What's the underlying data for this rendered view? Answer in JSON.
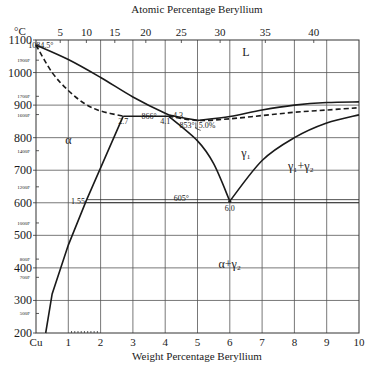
{
  "chart_data": {
    "type": "line",
    "xlabel": "Weight Percentage Beryllium",
    "x2label": "Atomic Percentage Beryllium",
    "ylabel": "°C",
    "xlim": [
      0,
      10
    ],
    "ylim": [
      200,
      1100
    ],
    "grid": true,
    "x_ticks": [
      "Cu",
      "1",
      "2",
      "3",
      "4",
      "5",
      "6",
      "7",
      "8",
      "9",
      "10"
    ],
    "x2_ticks": [
      {
        "label": "5",
        "wt": 0.75
      },
      {
        "label": "10",
        "wt": 1.56
      },
      {
        "label": "15",
        "wt": 2.44
      },
      {
        "label": "20",
        "wt": 3.4
      },
      {
        "label": "25",
        "wt": 4.5
      },
      {
        "label": "30",
        "wt": 5.7
      },
      {
        "label": "35",
        "wt": 7.1
      },
      {
        "label": "40",
        "wt": 8.6
      }
    ],
    "y_ticks": [
      {
        "label": "1100",
        "value": 1100
      },
      {
        "label": "1000",
        "value": 1000
      },
      {
        "label": "900",
        "value": 900
      },
      {
        "label": "800",
        "value": 800
      },
      {
        "label": "700",
        "value": 700
      },
      {
        "label": "600",
        "value": 600
      },
      {
        "label": "500",
        "value": 500
      },
      {
        "label": "400",
        "value": 400
      },
      {
        "label": "300",
        "value": 300
      },
      {
        "label": "200",
        "value": 200
      }
    ],
    "fahrenheit_ticks": [
      {
        "label": "1900F",
        "value": 1038
      },
      {
        "label": "1700F",
        "value": 927
      },
      {
        "label": "1600F",
        "value": 871
      },
      {
        "label": "1400F",
        "value": 760
      },
      {
        "label": "1200F",
        "value": 649
      },
      {
        "label": "1000F",
        "value": 538
      },
      {
        "label": "800F",
        "value": 427
      },
      {
        "label": "700F",
        "value": 371
      },
      {
        "label": "500F",
        "value": 260
      }
    ],
    "series": [
      {
        "name": "liquidus-alpha",
        "style": "solid",
        "points": [
          [
            0,
            1084.5
          ],
          [
            1,
            1040
          ],
          [
            2,
            985
          ],
          [
            3,
            925
          ],
          [
            4,
            875
          ],
          [
            4.3,
            866
          ],
          [
            5,
            853
          ]
        ]
      },
      {
        "name": "liquidus-gamma",
        "style": "solid",
        "points": [
          [
            5,
            853
          ],
          [
            6,
            865
          ],
          [
            7,
            885
          ],
          [
            8,
            900
          ],
          [
            9,
            908
          ],
          [
            10,
            910
          ]
        ]
      },
      {
        "name": "solidus-alpha",
        "style": "dashed",
        "points": [
          [
            0,
            1084.5
          ],
          [
            0.5,
            1000
          ],
          [
            1,
            945
          ],
          [
            1.5,
            905
          ],
          [
            2,
            882
          ],
          [
            2.7,
            866
          ]
        ]
      },
      {
        "name": "solidus-gamma",
        "style": "dashed",
        "points": [
          [
            4.1,
            866
          ],
          [
            5,
            853
          ],
          [
            6,
            858
          ],
          [
            7,
            868
          ],
          [
            8,
            878
          ],
          [
            9,
            885
          ],
          [
            10,
            892
          ]
        ]
      },
      {
        "name": "peritectic-line",
        "style": "solid",
        "points": [
          [
            2.7,
            866
          ],
          [
            4.1,
            866
          ]
        ]
      },
      {
        "name": "alpha-solvus",
        "style": "solid",
        "points": [
          [
            2.7,
            866
          ],
          [
            1.55,
            605
          ],
          [
            1,
            470
          ],
          [
            0.5,
            320
          ],
          [
            0.3,
            200
          ]
        ]
      },
      {
        "name": "gamma1-boundary-left",
        "style": "solid",
        "points": [
          [
            4.1,
            866
          ],
          [
            5,
            790
          ],
          [
            5.5,
            720
          ],
          [
            6,
            605
          ]
        ]
      },
      {
        "name": "gamma1-boundary-right",
        "style": "solid",
        "points": [
          [
            6,
            605
          ],
          [
            7,
            730
          ],
          [
            8,
            800
          ],
          [
            9,
            845
          ],
          [
            10,
            870
          ]
        ]
      },
      {
        "name": "eutectoid-line",
        "style": "double",
        "points": [
          [
            1.55,
            605
          ],
          [
            10,
            605
          ]
        ]
      }
    ],
    "annotations": [
      {
        "text": "1084.5°",
        "x": 0.15,
        "y": 1084.5
      },
      {
        "text": "866°",
        "x": 3.5,
        "y": 866
      },
      {
        "text": "4.3",
        "x": 4.4,
        "y": 870
      },
      {
        "text": "2.7",
        "x": 2.7,
        "y": 850
      },
      {
        "text": "4.1",
        "x": 4.0,
        "y": 850
      },
      {
        "text": "853°, 5.0%",
        "x": 5.0,
        "y": 840
      },
      {
        "text": "1.55",
        "x": 1.3,
        "y": 605
      },
      {
        "text": "605°",
        "x": 4.5,
        "y": 615
      },
      {
        "text": "6.0",
        "x": 6.0,
        "y": 585
      }
    ],
    "regions": [
      {
        "label": "L",
        "x": 6.5,
        "y": 1050
      },
      {
        "label": "α",
        "x": 1.0,
        "y": 780
      },
      {
        "label": "γ₁",
        "x": 6.5,
        "y": 740
      },
      {
        "label": "γ₁+γ₂",
        "x": 8.2,
        "y": 700
      },
      {
        "label": "α+γ₂",
        "x": 6.0,
        "y": 400
      }
    ]
  },
  "labels": {
    "top_axis_title": "Atomic Percentage Beryllium",
    "bottom_axis_title": "Weight Percentage Beryllium",
    "y_unit": "°C"
  }
}
